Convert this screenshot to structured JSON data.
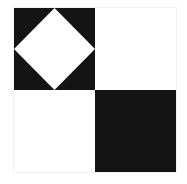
{
  "figure": {
    "background_color": "#ffffff",
    "ink_color": "#141414",
    "paper_color": "#ffffff",
    "border_color": "#f2f2f2",
    "grid": {
      "rows": 2,
      "columns": 2
    },
    "bounds": {
      "x": 14,
      "y": 8,
      "width": 162,
      "height": 164
    },
    "quadrants": [
      {
        "position": "top-left",
        "fill": "black",
        "fill_color": "#141414",
        "motif": "inscribed-diamond",
        "motif_fill": "white",
        "motif_fill_color": "#ffffff",
        "label": "black square with white diamond"
      },
      {
        "position": "top-right",
        "fill": "white",
        "fill_color": "#ffffff",
        "motif": "none",
        "motif_fill": "",
        "motif_fill_color": "",
        "label": "white square"
      },
      {
        "position": "bottom-left",
        "fill": "white",
        "fill_color": "#ffffff",
        "motif": "none",
        "motif_fill": "",
        "motif_fill_color": "",
        "label": "white square"
      },
      {
        "position": "bottom-right",
        "fill": "black",
        "fill_color": "#141414",
        "motif": "none",
        "motif_fill": "",
        "motif_fill_color": "",
        "label": "black square"
      }
    ],
    "diamond": {
      "description": "rotated square touching the midpoint of each side of its containing square",
      "vertices": [
        {
          "x": 50,
          "y": 0
        },
        {
          "x": 100,
          "y": 50
        },
        {
          "x": 50,
          "y": 100
        },
        {
          "x": 0,
          "y": 50
        }
      ],
      "points_attr": "50,0 100,50 50,100 0,50"
    }
  }
}
